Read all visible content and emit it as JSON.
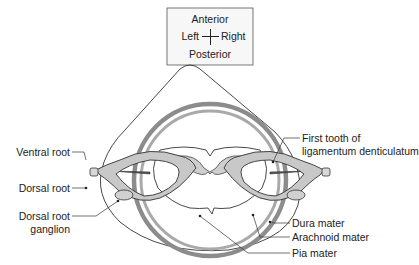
{
  "orientation_box": {
    "top": "Anterior",
    "left": "Left",
    "right": "Right",
    "bottom": "Posterior"
  },
  "labels": {
    "ventral_root": "Ventral root",
    "dorsal_root": "Dorsal root",
    "dorsal_root_ganglion_line1": "Dorsal root",
    "dorsal_root_ganglion_line2": "ganglion",
    "first_tooth_line1": "First tooth of",
    "first_tooth_line2": "ligamentum denticulatum",
    "dura_mater": "Dura mater",
    "arachnoid_mater": "Arachnoid mater",
    "pia_mater": "Pia mater"
  },
  "colors": {
    "dura": "#8a8a8a",
    "arachnoid": "#a8a8a8",
    "root_fill": "#c8c8c8",
    "outline": "#333333"
  }
}
